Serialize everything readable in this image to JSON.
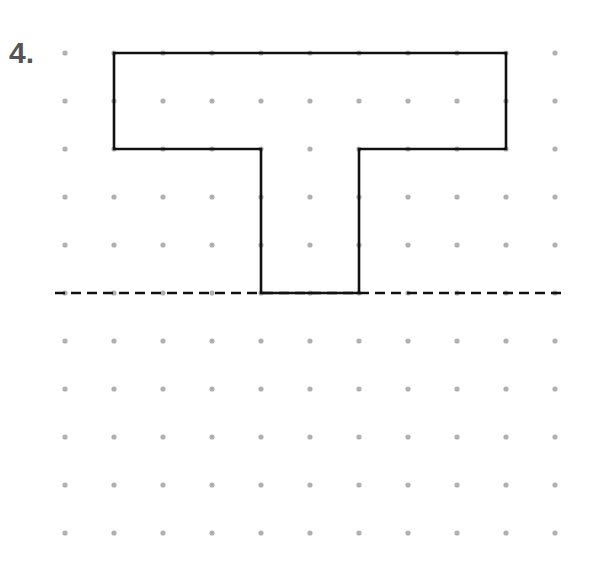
{
  "problem": {
    "number_label": "4."
  },
  "grid": {
    "columns": 11,
    "rows": 11,
    "x0": 65,
    "y0": 53,
    "dx": 49,
    "dy": 48,
    "dot_radius": 2.6,
    "dot_color": "#b0b0b0"
  },
  "shape": {
    "name": "T-shape",
    "stroke": "#111111",
    "stroke_width": 2.6,
    "grid_vertices": [
      [
        1,
        0
      ],
      [
        9,
        0
      ],
      [
        9,
        2
      ],
      [
        6,
        2
      ],
      [
        6,
        5
      ],
      [
        4,
        5
      ],
      [
        4,
        2
      ],
      [
        1,
        2
      ]
    ]
  },
  "line_of_reflection": {
    "style": "dashed",
    "color": "#111111",
    "grid_row": 5,
    "x_start": 55,
    "x_end": 562
  }
}
